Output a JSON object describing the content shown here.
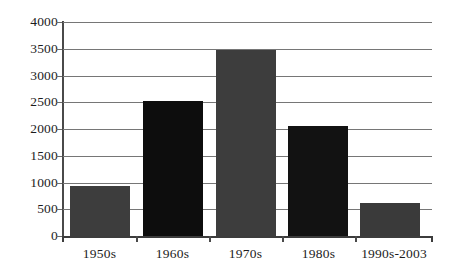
{
  "chart_data": {
    "type": "bar",
    "title": "",
    "subtitle": "",
    "xlabel": "",
    "ylabel": "",
    "categories": [
      "1950s",
      "1960s",
      "1970s",
      "1980s",
      "1990s-2003"
    ],
    "values": [
      930,
      2530,
      3470,
      2060,
      615
    ],
    "series": [
      {
        "name": "",
        "values": [
          930,
          2530,
          3470,
          2060,
          615
        ]
      }
    ],
    "ylim": [
      0,
      4000
    ],
    "yticks": [
      0,
      500,
      1000,
      1500,
      2000,
      2500,
      3000,
      3500,
      4000
    ],
    "ytick_labels": [
      "0",
      "500",
      "1000",
      "1500",
      "2000",
      "2500",
      "3000",
      "3500",
      "4000"
    ],
    "grid": true,
    "grid_axis": "y",
    "legend": false,
    "legend_position": "none",
    "bar_colors": [
      "#3d3d3d",
      "#0d0d0d",
      "#3d3d3d",
      "#121212",
      "#3a3a3a"
    ],
    "colors": {
      "gridline": "#767676",
      "axis": "#3c3c3c",
      "background": "#ffffff",
      "text": "#1c1c1c",
      "bar_dark_gray": "#3d3d3d",
      "bar_black": "#0d0d0d"
    },
    "annotations": []
  }
}
